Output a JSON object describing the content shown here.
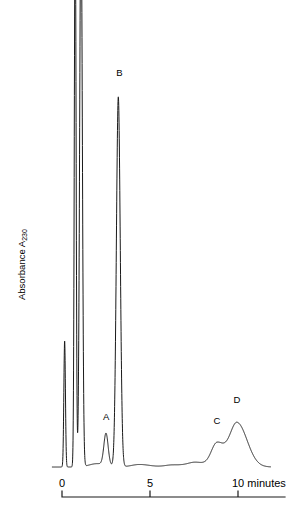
{
  "figure": {
    "type": "chromatogram",
    "background_color": "#ffffff",
    "trace_color": "#1a1a1a",
    "axis_color": "#1a1a1a"
  },
  "chart_data": {
    "type": "line",
    "title": "",
    "subtitle": "",
    "xlabel": "minutes",
    "ylabel": "Absorbance A230",
    "ylabel_base": "Absorbance A",
    "ylabel_subscript": "230",
    "grid": false,
    "legend": false,
    "legend_position": "none",
    "xlim": [
      -0.4,
      11.8
    ],
    "ylim": [
      0,
      100
    ],
    "x_ticks": [
      0,
      5,
      10
    ],
    "x_tick_labels": [
      "0",
      "5",
      "10 minutes"
    ],
    "y_ticks": [],
    "y_tick_labels": [],
    "axis_style": "bottom-only-bracket",
    "annotations": [
      {
        "text": "A",
        "x": 2.5,
        "y": 10
      },
      {
        "text": "B",
        "x": 3.25,
        "y": 92
      },
      {
        "text": "C",
        "x": 8.8,
        "y": 9
      },
      {
        "text": "D",
        "x": 9.95,
        "y": 14
      }
    ],
    "peaks": [
      {
        "name": "injection",
        "label": "",
        "x": 0.15,
        "height": 30,
        "width": 0.045,
        "shape": "spike",
        "off_scale": false
      },
      {
        "name": "solvent-1",
        "label": "",
        "x": 0.75,
        "height": 135,
        "width": 0.05,
        "shape": "spike",
        "off_scale": true
      },
      {
        "name": "solvent-2",
        "label": "",
        "x": 1.08,
        "height": 135,
        "width": 0.075,
        "shape": "spike",
        "off_scale": true
      },
      {
        "name": "A",
        "label": "A",
        "x": 2.5,
        "height": 7.5,
        "width": 0.12,
        "shape": "sharp",
        "off_scale": false
      },
      {
        "name": "B",
        "label": "B",
        "x": 3.2,
        "height": 88,
        "width": 0.11,
        "shape": "sharp",
        "off_scale": false
      },
      {
        "name": "C",
        "label": "C",
        "x": 8.8,
        "height": 5.5,
        "width": 0.32,
        "shape": "broad",
        "off_scale": false
      },
      {
        "name": "D",
        "label": "D",
        "x": 9.95,
        "height": 10.5,
        "width": 0.42,
        "shape": "broad",
        "off_scale": false
      }
    ],
    "baseline_ripples": [
      {
        "x": 2.0,
        "height": 0.8
      },
      {
        "x": 4.4,
        "height": 0.6
      },
      {
        "x": 6.3,
        "height": 0.5
      },
      {
        "x": 7.6,
        "height": 1.1
      }
    ],
    "series": [
      {
        "name": "absorbance",
        "x": [
          0.15,
          0.75,
          1.08,
          2.5,
          3.2,
          8.8,
          9.95
        ],
        "values": [
          30,
          135,
          135,
          7.5,
          88,
          5.5,
          10.5
        ]
      }
    ]
  }
}
